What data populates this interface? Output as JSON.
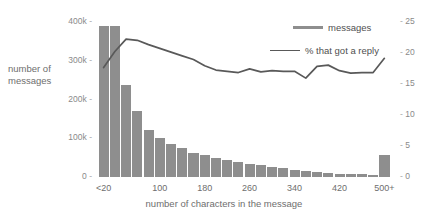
{
  "chart_data": {
    "type": "bar",
    "title": "",
    "subtitle": "",
    "xlabel": "number of characters in the message",
    "ylabel": "number of messages",
    "grid": false,
    "legend_position": "top-right",
    "categories": [
      "<20",
      "20",
      "40",
      "60",
      "80",
      "100",
      "120",
      "140",
      "160",
      "180",
      "200",
      "220",
      "240",
      "260",
      "280",
      "300",
      "320",
      "340",
      "360",
      "380",
      "400",
      "420",
      "440",
      "460",
      "480",
      "500+"
    ],
    "x_tick_labels": [
      "<20",
      "100",
      "180",
      "260",
      "340",
      "420",
      "500+"
    ],
    "x_tick_positions": [
      0,
      5,
      9,
      13,
      17,
      21,
      25
    ],
    "ylim": [
      0,
      400000
    ],
    "y_tick_labels": [
      "0",
      "100k",
      "200k",
      "300k",
      "400k"
    ],
    "y_tick_values": [
      0,
      100000,
      200000,
      300000,
      400000
    ],
    "y2lim": [
      0,
      25
    ],
    "y2_tick_labels": [
      "0",
      "5",
      "10",
      "15",
      "20",
      "25"
    ],
    "y2_tick_values": [
      0,
      5,
      10,
      15,
      20,
      25
    ],
    "series": [
      {
        "name": "messages",
        "type": "bar",
        "axis": "left",
        "color": "#8e8e8e",
        "values": [
          390000,
          390000,
          238000,
          170000,
          122000,
          100000,
          84000,
          74000,
          62000,
          56000,
          50000,
          44000,
          38000,
          34000,
          30000,
          26000,
          22000,
          19000,
          16000,
          13000,
          11000,
          9000,
          8000,
          7000,
          4000,
          56000
        ]
      },
      {
        "name": "% that got a reply",
        "type": "line",
        "axis": "right",
        "color": "#595959",
        "values": [
          17.0,
          19.6,
          21.6,
          21.4,
          20.7,
          20.1,
          19.5,
          18.9,
          18.3,
          17.3,
          16.6,
          16.4,
          16.2,
          16.8,
          16.3,
          16.5,
          16.4,
          16.4,
          15.3,
          17.2,
          17.4,
          16.5,
          16.1,
          16.2,
          16.2,
          18.5
        ]
      }
    ],
    "legend": [
      {
        "label": "messages",
        "color": "#8e8e8e",
        "style": "thick"
      },
      {
        "label": "% that got a reply",
        "color": "#595959",
        "style": "thin"
      }
    ],
    "tick_mark": "-"
  }
}
